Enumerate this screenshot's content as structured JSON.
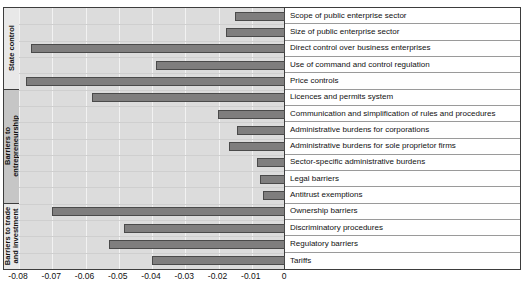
{
  "title": "",
  "chart_data": {
    "type": "bar",
    "orientation": "horizontal",
    "title": "",
    "xlabel": "",
    "ylabel": "",
    "xlim": [
      -0.08,
      0
    ],
    "xticks": [
      "-0.08",
      "-0.07",
      "-0.06",
      "-0.05",
      "-0.04",
      "-0.03",
      "-0.02",
      "-0.01",
      "0"
    ],
    "xtick_values": [
      -0.08,
      -0.07,
      -0.06,
      -0.05,
      -0.04,
      -0.03,
      -0.02,
      -0.01,
      0
    ],
    "grid": true,
    "legend": "none",
    "bar_color": "#7f7e7e",
    "bar_edge_color": "#4a4a4a",
    "groups": [
      {
        "name": "State control",
        "count": 5
      },
      {
        "name": "Barriers to entrepreneurship",
        "count": 7
      },
      {
        "name": "Barriers to trade and investment",
        "count": 4
      }
    ],
    "categories": [
      "Scope of public enterprise sector",
      "Size of public enterprise sector",
      "Direct control over business enterprises",
      "Use of command and control regulation",
      "Price controls",
      "Licences and permits system",
      "Communication and simplification of rules and procedures",
      "Administrative burdens for corporations",
      "Administrative burdens for sole proprietor firms",
      "Sector-specific administrative burdens",
      "Legal barriers",
      "Antitrust exemptions",
      "Ownership barriers",
      "Discriminatory procedures",
      "Regulatory barriers",
      "Tariffs"
    ],
    "values": [
      -0.0149,
      -0.0176,
      -0.0764,
      -0.0388,
      -0.0779,
      -0.0579,
      -0.0203,
      -0.0145,
      -0.0167,
      -0.0085,
      -0.0076,
      -0.0067,
      -0.07,
      -0.0485,
      -0.053,
      -0.04
    ]
  }
}
